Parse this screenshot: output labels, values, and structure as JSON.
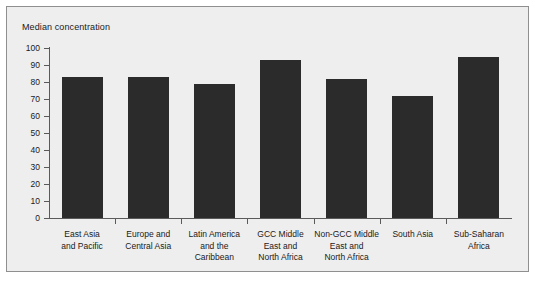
{
  "chart_data": {
    "type": "bar",
    "title": "",
    "ylabel": "Median concentration",
    "xlabel": "",
    "ylim": [
      0,
      100
    ],
    "yticks": [
      0,
      10,
      20,
      30,
      40,
      50,
      60,
      70,
      80,
      90,
      100
    ],
    "grid": false,
    "legend": null,
    "bar_color": "#2b2b2b",
    "panel_color": "#eeeeee",
    "categories": [
      "East Asia\nand Pacific",
      "Europe and\nCentral Asia",
      "Latin America\nand the\nCaribbean",
      "GCC Middle\nEast and\nNorth Africa",
      "Non-GCC Middle\nEast and\nNorth Africa",
      "South Asia",
      "Sub-Saharan\nAfrica"
    ],
    "values": [
      83,
      83,
      79,
      93,
      82,
      72,
      95
    ]
  }
}
